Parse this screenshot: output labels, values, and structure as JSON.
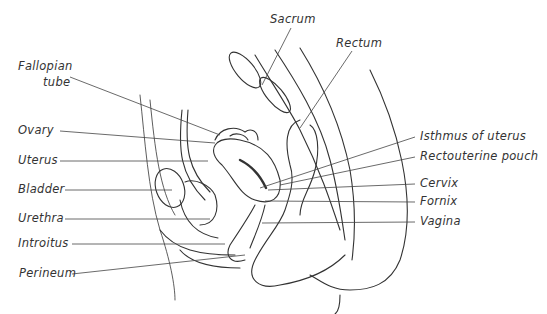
{
  "diagram": {
    "title": "",
    "labels_left": [
      {
        "id": "fallopian-tube",
        "text": "Fallopian tube",
        "lines": [
          "Fallopian",
          "tube"
        ]
      },
      {
        "id": "ovary",
        "text": "Ovary"
      },
      {
        "id": "uterus",
        "text": "Uterus"
      },
      {
        "id": "bladder",
        "text": "Bladder"
      },
      {
        "id": "urethra",
        "text": "Urethra"
      },
      {
        "id": "introitus",
        "text": "Introitus"
      },
      {
        "id": "perineum",
        "text": "Perineum"
      }
    ],
    "labels_top": [
      {
        "id": "sacrum",
        "text": "Sacrum"
      },
      {
        "id": "rectum",
        "text": "Rectum"
      }
    ],
    "labels_right": [
      {
        "id": "isthmus",
        "text": "Isthmus of uterus"
      },
      {
        "id": "rectouterine-pouch",
        "text": "Rectouterine pouch"
      },
      {
        "id": "cervix",
        "text": "Cervix"
      },
      {
        "id": "fornix",
        "text": "Fornix"
      },
      {
        "id": "vagina",
        "text": "Vagina"
      }
    ],
    "line_color": "#444444"
  }
}
